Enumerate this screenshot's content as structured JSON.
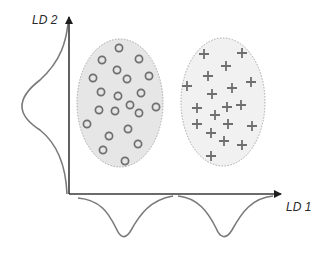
{
  "diagram": {
    "axes": {
      "x_label": "LD 1",
      "y_label": "LD 2",
      "origin": [
        69,
        194
      ],
      "x_end": [
        283,
        194
      ],
      "y_end": [
        69,
        15
      ]
    },
    "colors": {
      "axis": "#3a3a3a",
      "curve": "#7a7a7a",
      "marker": "#6f6f6f",
      "cluster_fill": "#ececec",
      "cluster_stroke": "#a8a8a8"
    },
    "clusters": [
      {
        "name": "class-circles",
        "marker": "circle",
        "ellipse": {
          "cx": 120,
          "cy": 103,
          "rx": 43,
          "ry": 64
        },
        "points": [
          [
            119,
            48
          ],
          [
            102,
            60
          ],
          [
            139,
            59
          ],
          [
            117,
            70
          ],
          [
            93,
            78
          ],
          [
            127,
            79
          ],
          [
            149,
            76
          ],
          [
            101,
            92
          ],
          [
            118,
            96
          ],
          [
            141,
            93
          ],
          [
            99,
            110
          ],
          [
            115,
            111
          ],
          [
            130,
            105
          ],
          [
            139,
            113
          ],
          [
            156,
            107
          ],
          [
            87,
            124
          ],
          [
            109,
            136
          ],
          [
            128,
            129
          ],
          [
            138,
            144
          ],
          [
            103,
            150
          ],
          [
            125,
            161
          ]
        ]
      },
      {
        "name": "class-pluses",
        "marker": "plus",
        "ellipse": {
          "cx": 223,
          "cy": 102,
          "rx": 42,
          "ry": 64
        },
        "points": [
          [
            204,
            54
          ],
          [
            242,
            53
          ],
          [
            226,
            66
          ],
          [
            208,
            76
          ],
          [
            187,
            86
          ],
          [
            251,
            82
          ],
          [
            232,
            88
          ],
          [
            212,
            94
          ],
          [
            197,
            108
          ],
          [
            215,
            115
          ],
          [
            227,
            107
          ],
          [
            241,
            105
          ],
          [
            197,
            124
          ],
          [
            228,
            124
          ],
          [
            252,
            126
          ],
          [
            211,
            133
          ],
          [
            224,
            141
          ],
          [
            242,
            145
          ],
          [
            211,
            156
          ]
        ]
      }
    ],
    "distributions": {
      "ld2_curve": "M 68 24 C 66 40, 62 60, 40 80 C 14 100, 18 116, 40 130 C 60 146, 66 170, 67 194",
      "ld1_curves": [
        "M 78 198 C 100 200, 108 212, 116 228 C 120 237, 124 240, 130 232 C 140 214, 150 200, 173 196",
        "M 178 196 C 198 198, 208 212, 216 228 C 220 238, 226 240, 232 230 C 242 212, 252 198, 273 196"
      ]
    }
  }
}
